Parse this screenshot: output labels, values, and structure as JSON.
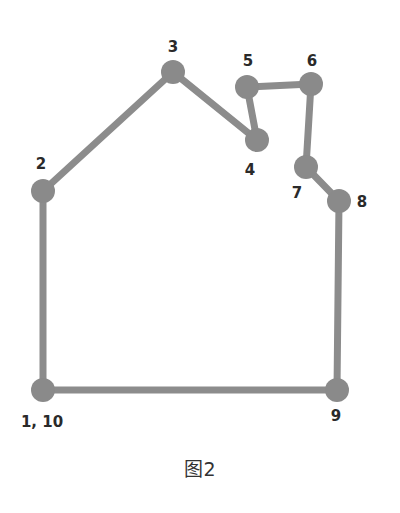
{
  "diagram": {
    "caption": "图2",
    "edge_color": "#8c8c8c",
    "node_color": "#8a8a8a",
    "label_color": "#2a2a2a",
    "nodes": [
      {
        "id": "1",
        "label": "1, 10",
        "x": 43,
        "y": 390,
        "lx": 42,
        "ly": 422
      },
      {
        "id": "2",
        "label": "2",
        "x": 43,
        "y": 191,
        "lx": 41,
        "ly": 164
      },
      {
        "id": "3",
        "label": "3",
        "x": 173,
        "y": 72,
        "lx": 173,
        "ly": 47
      },
      {
        "id": "4",
        "label": "4",
        "x": 257,
        "y": 140,
        "lx": 250,
        "ly": 170
      },
      {
        "id": "5",
        "label": "5",
        "x": 247,
        "y": 87,
        "lx": 248,
        "ly": 61
      },
      {
        "id": "6",
        "label": "6",
        "x": 311,
        "y": 84,
        "lx": 312,
        "ly": 61
      },
      {
        "id": "7",
        "label": "7",
        "x": 306,
        "y": 167,
        "lx": 297,
        "ly": 193
      },
      {
        "id": "8",
        "label": "8",
        "x": 339,
        "y": 201,
        "lx": 362,
        "ly": 202
      },
      {
        "id": "9",
        "label": "9",
        "x": 337,
        "y": 390,
        "lx": 336,
        "ly": 416
      }
    ],
    "path_order": [
      "1",
      "2",
      "3",
      "4",
      "5",
      "6",
      "7",
      "8",
      "9",
      "1"
    ]
  }
}
